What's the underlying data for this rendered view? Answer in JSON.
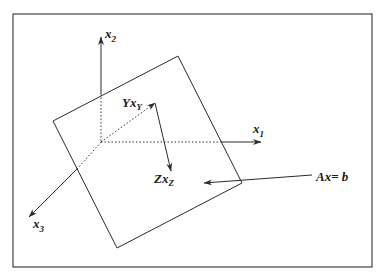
{
  "diagram": {
    "title": "",
    "labels": {
      "x1": {
        "main": "x",
        "sub": "1"
      },
      "x2": {
        "main": "x",
        "sub": "2"
      },
      "x3": {
        "main": "x",
        "sub": "3"
      },
      "yxy": {
        "main": "Yx",
        "sub": "Y"
      },
      "zxz": {
        "main": "Zx",
        "sub": "Z"
      },
      "axb": "Ax= b"
    },
    "elements": [
      {
        "id": "frame",
        "type": "rectangle"
      },
      {
        "id": "plane",
        "type": "tilted-square",
        "represents": "Ax=b"
      },
      {
        "id": "axis-x1",
        "type": "arrow"
      },
      {
        "id": "axis-x2",
        "type": "arrow"
      },
      {
        "id": "axis-x3",
        "type": "arrow"
      },
      {
        "id": "vector-Yxy",
        "type": "arrow"
      },
      {
        "id": "vector-Zxz",
        "type": "arrow"
      },
      {
        "id": "pointer-Axb",
        "type": "arrow"
      }
    ],
    "colors": {
      "stroke": "#2a2a2a",
      "background": "#ffffff",
      "frame": "#444444"
    }
  }
}
